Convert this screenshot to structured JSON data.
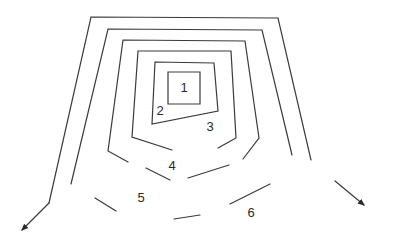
{
  "diagram": {
    "type": "concentric-zones",
    "stroke_color": "#3a3a3a",
    "zone_labels": [
      {
        "id": "1",
        "text": "1",
        "x": 184,
        "y": 89
      },
      {
        "id": "2",
        "text": "2",
        "x": 160,
        "y": 112
      },
      {
        "id": "3",
        "text": "3",
        "x": 210,
        "y": 128
      },
      {
        "id": "4",
        "text": "4",
        "x": 172,
        "y": 167
      },
      {
        "id": "5",
        "text": "5",
        "x": 141,
        "y": 199
      },
      {
        "id": "6",
        "text": "6",
        "x": 251,
        "y": 214
      }
    ],
    "arrows": [
      {
        "name": "outward-arrow-left",
        "direction": "down-left"
      },
      {
        "name": "outward-arrow-right",
        "direction": "down-right"
      }
    ]
  }
}
